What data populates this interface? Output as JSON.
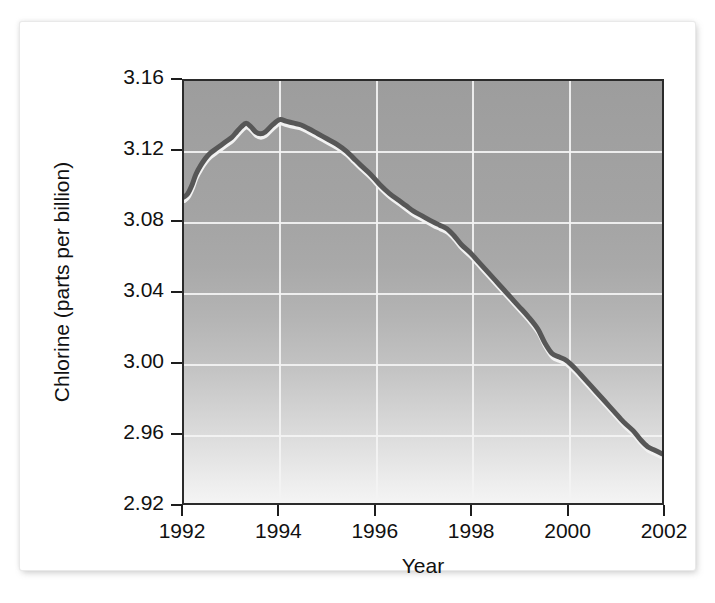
{
  "chart_data": {
    "type": "line",
    "title": "",
    "xlabel": "Year",
    "ylabel": "Chlorine (parts per billion)",
    "xlim": [
      1992,
      2002
    ],
    "ylim": [
      2.92,
      3.16
    ],
    "grid": true,
    "legend": null,
    "xticks": [
      "1992",
      "1994",
      "1996",
      "1998",
      "2000",
      "2002"
    ],
    "xtick_values": [
      1992,
      1994,
      1996,
      1998,
      2000,
      2002
    ],
    "yticks": [
      "2.92",
      "2.96",
      "3.00",
      "3.04",
      "3.08",
      "3.12",
      "3.16"
    ],
    "ytick_values": [
      2.92,
      2.96,
      3.0,
      3.04,
      3.08,
      3.12,
      3.16
    ],
    "series": [
      {
        "name": "Chlorine",
        "color": "#575757",
        "x": [
          1992.0,
          1992.08,
          1992.17,
          1992.25,
          1992.35,
          1992.45,
          1992.55,
          1992.7,
          1992.85,
          1993.0,
          1993.1,
          1993.2,
          1993.3,
          1993.4,
          1993.5,
          1993.6,
          1993.7,
          1993.85,
          1994.0,
          1994.15,
          1994.3,
          1994.45,
          1994.6,
          1994.8,
          1995.0,
          1995.2,
          1995.4,
          1995.55,
          1995.7,
          1995.9,
          1996.1,
          1996.3,
          1996.5,
          1996.65,
          1996.8,
          1997.0,
          1997.2,
          1997.35,
          1997.5,
          1997.65,
          1997.8,
          1998.0,
          1998.2,
          1998.4,
          1998.6,
          1998.8,
          1999.0,
          1999.2,
          1999.4,
          1999.55,
          1999.7,
          1999.85,
          2000.0,
          2000.2,
          2000.4,
          2000.6,
          2000.8,
          2001.0,
          2001.2,
          2001.4,
          2001.55,
          2001.7,
          2001.85,
          2002.0
        ],
        "y": [
          3.094,
          3.096,
          3.101,
          3.107,
          3.112,
          3.116,
          3.119,
          3.122,
          3.125,
          3.128,
          3.131,
          3.134,
          3.136,
          3.134,
          3.131,
          3.13,
          3.131,
          3.135,
          3.138,
          3.137,
          3.136,
          3.135,
          3.133,
          3.13,
          3.127,
          3.124,
          3.12,
          3.116,
          3.112,
          3.107,
          3.101,
          3.096,
          3.092,
          3.089,
          3.086,
          3.083,
          3.08,
          3.078,
          3.076,
          3.072,
          3.067,
          3.062,
          3.056,
          3.05,
          3.044,
          3.038,
          3.032,
          3.026,
          3.019,
          3.011,
          3.005,
          3.003,
          3.001,
          2.996,
          2.99,
          2.984,
          2.978,
          2.972,
          2.966,
          2.961,
          2.956,
          2.952,
          2.95,
          2.948
        ]
      }
    ]
  },
  "axes": {
    "y_title": "Chlorine (parts per billion)",
    "x_title": "Year"
  },
  "colors": {
    "line": "#575757",
    "line_highlight": "#f2f2f2",
    "grid": "#f3f3f3",
    "frame": "#2b2b2b",
    "panel": "#ffffff",
    "plot_top": "#9d9d9d",
    "plot_bottom": "#f4f4f4"
  }
}
